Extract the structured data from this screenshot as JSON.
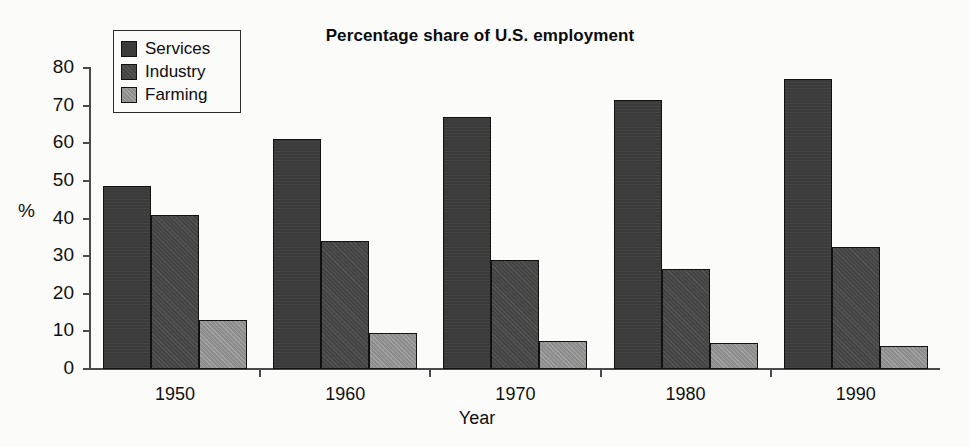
{
  "chart_data": {
    "type": "bar",
    "title": "Percentage share of U.S. employment",
    "xlabel": "Year",
    "ylabel": "%",
    "categories": [
      "1950",
      "1960",
      "1970",
      "1980",
      "1990"
    ],
    "series": [
      {
        "name": "Services",
        "color": "#3b3b3b",
        "values": [
          48,
          60.5,
          66.5,
          71,
          76.5
        ]
      },
      {
        "name": "Industry",
        "color": "#454545",
        "values": [
          40.5,
          33.5,
          28.5,
          26,
          32
        ]
      },
      {
        "name": "Farming",
        "color": "#8d8d8d",
        "values": [
          12.5,
          9,
          7,
          6.5,
          5.5
        ]
      }
    ],
    "ylim": [
      0,
      80
    ],
    "yticks": [
      0,
      10,
      20,
      30,
      40,
      50,
      60,
      70,
      80
    ],
    "ytick_labels": [
      "0",
      "10",
      "20",
      "30",
      "40",
      "50",
      "60",
      "70",
      "80"
    ],
    "grid": false,
    "legend_position": "top-left",
    "legend_entries": [
      "Services",
      "Industry",
      "Farming"
    ]
  }
}
